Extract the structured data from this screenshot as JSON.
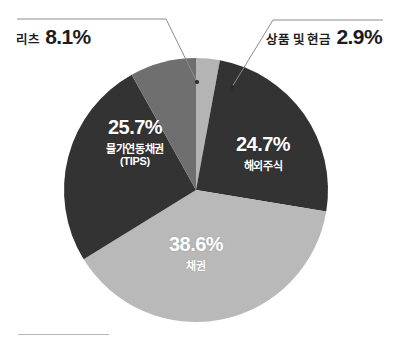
{
  "chart_data": {
    "type": "pie",
    "title": "",
    "subtitle": "",
    "xlabel": "",
    "ylabel": "",
    "legend_position": "none",
    "grid": false,
    "units": "%",
    "start_angle_deg": 0,
    "direction": "clockwise",
    "center": {
      "cx": 196,
      "cy": 190,
      "r": 132
    },
    "categories": [
      "상품 및 현금",
      "해외주식",
      "채권",
      "물가연동채권 (TIPS)",
      "리츠"
    ],
    "values": [
      2.9,
      24.7,
      38.6,
      25.7,
      8.1
    ],
    "colors": [
      "#b4b4b4",
      "#333333",
      "#b9b9b9",
      "#333333",
      "#6f6f6f"
    ],
    "slices": [
      {
        "name": "commodity-cash",
        "category": "상품 및 현금",
        "value": 2.9,
        "value_text": "2.9%",
        "color": "#b4b4b4",
        "label_placement": "callout-right"
      },
      {
        "name": "global-equity",
        "category": "해외주식",
        "value": 24.7,
        "value_text": "24.7%",
        "color": "#333333",
        "label_placement": "inside"
      },
      {
        "name": "bonds",
        "category": "채권",
        "value": 38.6,
        "value_text": "38.6%",
        "color": "#b9b9b9",
        "label_placement": "inside"
      },
      {
        "name": "tips",
        "category": "물가연동채권",
        "category_sub": "(TIPS)",
        "value": 25.7,
        "value_text": "25.7%",
        "color": "#333333",
        "label_placement": "inside"
      },
      {
        "name": "reits",
        "category": "리츠",
        "value": 8.1,
        "value_text": "8.1%",
        "color": "#6f6f6f",
        "label_placement": "callout-left"
      }
    ]
  },
  "callouts": {
    "reits": {
      "category": "리츠",
      "value_text": "8.1%"
    },
    "commodity_cash": {
      "category": "상품 및 현금",
      "value_text": "2.9%"
    }
  },
  "inside_labels": {
    "tips": {
      "value_text": "25.7%",
      "category": "물가연동채권",
      "category_sub": "(TIPS)"
    },
    "global_equity": {
      "value_text": "24.7%",
      "category": "해외주식"
    },
    "bonds": {
      "value_text": "38.6%",
      "category": "채권"
    }
  },
  "style": {
    "background": "#ffffff",
    "leader_line_color": "#8c8c8c",
    "rule_color": "#b9b9b9",
    "label_text_color": "#1c1c1c",
    "inside_label_color": "#ffffff"
  }
}
